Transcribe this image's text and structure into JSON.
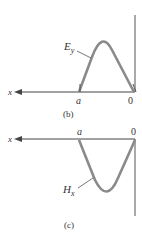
{
  "figure_b": {
    "caption": "(b)",
    "axis_label": "x",
    "point_a": "a",
    "origin": "0",
    "curve_label_main": "E",
    "curve_label_sub": "y"
  },
  "figure_c": {
    "caption": "(c)",
    "axis_label": "x",
    "point_a": "a",
    "origin": "0",
    "curve_label_main": "H",
    "curve_label_sub": "x"
  },
  "colors": {
    "curve": "#8a8a8a",
    "axis": "#444444"
  }
}
